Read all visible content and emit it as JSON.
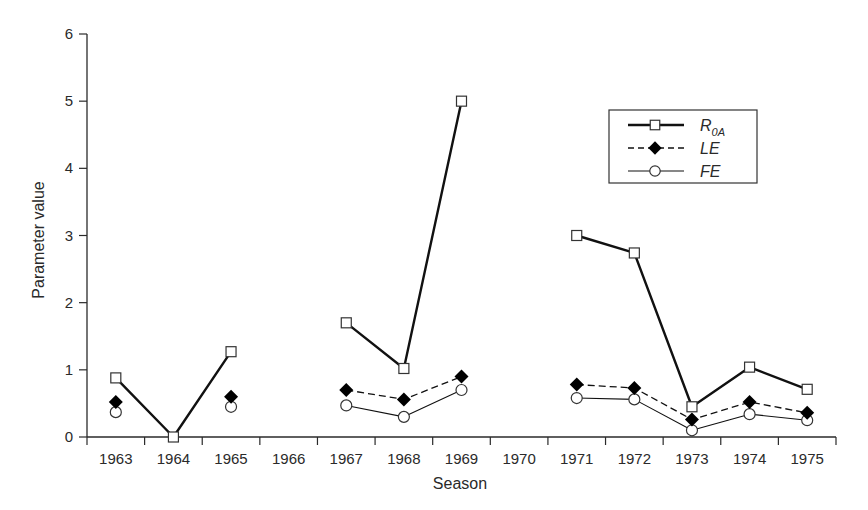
{
  "chart_data": {
    "type": "line",
    "title": "",
    "xlabel": "Season",
    "ylabel": "Parameter value",
    "ylim": [
      0,
      6
    ],
    "yticks": [
      0,
      1,
      2,
      3,
      4,
      5,
      6
    ],
    "grid": false,
    "legend_position": "upper right (inside plot)",
    "categories": [
      "1963",
      "1964",
      "1965",
      "1966",
      "1967",
      "1968",
      "1969",
      "1970",
      "1971",
      "1972",
      "1973",
      "1974",
      "1975"
    ],
    "series": [
      {
        "name": "R0A",
        "label_main": "R",
        "label_sub": "0A",
        "marker": "open-square",
        "line_style": "solid-thick",
        "values": [
          0.88,
          0.0,
          1.27,
          null,
          1.7,
          1.02,
          5.0,
          null,
          3.0,
          2.74,
          0.45,
          1.04,
          0.71
        ]
      },
      {
        "name": "LE",
        "label_main": "LE",
        "label_sub": "",
        "marker": "filled-diamond",
        "line_style": "dashed",
        "values": [
          0.52,
          null,
          0.6,
          null,
          0.7,
          0.56,
          0.9,
          null,
          0.78,
          0.73,
          0.26,
          0.52,
          0.36
        ]
      },
      {
        "name": "FE",
        "label_main": "FE",
        "label_sub": "",
        "marker": "open-circle",
        "line_style": "solid-thin",
        "values": [
          0.37,
          null,
          0.45,
          null,
          0.47,
          0.3,
          0.7,
          null,
          0.58,
          0.56,
          0.1,
          0.34,
          0.25
        ]
      }
    ]
  },
  "colors": {
    "axis": "#2a2a2a",
    "line": "#111111",
    "marker_fill_open": "#ffffff",
    "marker_fill_solid": "#000000"
  }
}
